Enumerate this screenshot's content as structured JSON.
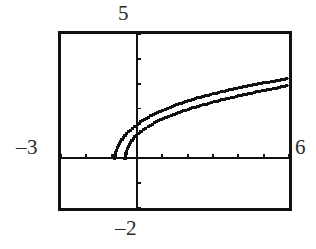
{
  "figure": {
    "kind": "graphing-calculator-plot",
    "background_color": "#ffffff",
    "ink_color": "#111111",
    "frame": {
      "x": 58,
      "y": 31,
      "width": 234,
      "height": 180,
      "border_px": 3
    }
  },
  "labels": {
    "y_max": "5",
    "y_min": "–2",
    "x_min": "–3",
    "x_max": "6"
  },
  "chart_data": {
    "type": "line",
    "title": "",
    "subtitle": "",
    "xlabel": "",
    "ylabel": "",
    "xlim": [
      -3,
      6
    ],
    "ylim": [
      -2,
      5
    ],
    "grid": false,
    "legend": "none",
    "axes": {
      "x_axis_at_y": 0,
      "y_axis_at_x": 0,
      "x_tick_interval": 1,
      "y_tick_interval": 1,
      "x_ticks": [
        -3,
        -2,
        -1,
        0,
        1,
        2,
        3,
        4,
        5,
        6
      ],
      "y_ticks": [
        -2,
        -1,
        0,
        1,
        2,
        3,
        4,
        5
      ],
      "tick_length_px": 4,
      "axis_stroke_px": 2.2
    },
    "annotations": [],
    "series": [
      {
        "name": "curve-upper",
        "style": "dotted-pixelated",
        "x_start": -0.9,
        "x_end": 6,
        "points": [
          [
            -0.9,
            0.0
          ],
          [
            -0.85,
            0.22
          ],
          [
            -0.78,
            0.42
          ],
          [
            -0.7,
            0.58
          ],
          [
            -0.6,
            0.74
          ],
          [
            -0.48,
            0.9
          ],
          [
            -0.34,
            1.06
          ],
          [
            -0.18,
            1.21
          ],
          [
            0.0,
            1.36
          ],
          [
            0.22,
            1.51
          ],
          [
            0.46,
            1.66
          ],
          [
            0.72,
            1.8
          ],
          [
            1.0,
            1.93
          ],
          [
            1.32,
            2.06
          ],
          [
            1.66,
            2.19
          ],
          [
            2.02,
            2.31
          ],
          [
            2.4,
            2.43
          ],
          [
            2.8,
            2.54
          ],
          [
            3.22,
            2.65
          ],
          [
            3.66,
            2.76
          ],
          [
            4.12,
            2.86
          ],
          [
            4.6,
            2.96
          ],
          [
            5.1,
            3.05
          ],
          [
            5.6,
            3.14
          ],
          [
            6.0,
            3.21
          ]
        ]
      },
      {
        "name": "curve-lower",
        "style": "dotted-pixelated",
        "x_start": -0.48,
        "x_end": 6,
        "points": [
          [
            -0.48,
            0.0
          ],
          [
            -0.44,
            0.2
          ],
          [
            -0.38,
            0.38
          ],
          [
            -0.3,
            0.55
          ],
          [
            -0.2,
            0.71
          ],
          [
            -0.08,
            0.86
          ],
          [
            0.06,
            1.0
          ],
          [
            0.24,
            1.14
          ],
          [
            0.44,
            1.28
          ],
          [
            0.68,
            1.42
          ],
          [
            0.94,
            1.55
          ],
          [
            1.24,
            1.68
          ],
          [
            1.56,
            1.81
          ],
          [
            1.92,
            1.94
          ],
          [
            2.3,
            2.06
          ],
          [
            2.72,
            2.18
          ],
          [
            3.16,
            2.3
          ],
          [
            3.62,
            2.42
          ],
          [
            4.1,
            2.53
          ],
          [
            4.62,
            2.65
          ],
          [
            5.16,
            2.76
          ],
          [
            5.6,
            2.85
          ],
          [
            6.0,
            2.93
          ]
        ]
      }
    ]
  }
}
